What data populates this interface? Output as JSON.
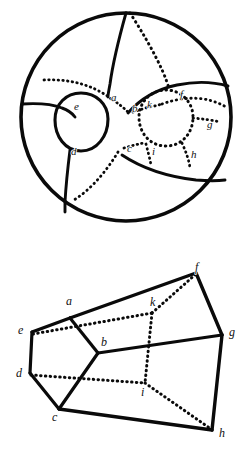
{
  "page": {
    "background_color": "#ffffff",
    "ink_color": "#0a0a0a",
    "width": 252,
    "height": 456
  },
  "figures": [
    {
      "id": "sphere-figure",
      "name": "sphere-with-two-holes-diagram",
      "description": "A circle (sphere outline) containing two inner ovals (holes) joined by solid and dotted curves dividing the surface into regions.",
      "outline": {
        "shape": "circle",
        "center_x": 126,
        "center_y": 117,
        "radius_x": 105,
        "radius_y": 104,
        "stroke_width": 3.4
      },
      "holes": [
        {
          "name": "left-hole",
          "center_x": 81,
          "center_y": 122,
          "rx": 26,
          "ry": 29,
          "style": "solid"
        },
        {
          "name": "right-hole",
          "center_x": 166,
          "center_y": 118,
          "rx": 27,
          "ry": 28,
          "style": "dotted"
        }
      ],
      "labels": [
        {
          "text": "a",
          "x": 111,
          "y": 101
        },
        {
          "text": "b",
          "x": 132,
          "y": 112
        },
        {
          "text": "c",
          "x": 127,
          "y": 152
        },
        {
          "text": "d",
          "x": 71,
          "y": 155
        },
        {
          "text": "e",
          "x": 74,
          "y": 110
        },
        {
          "text": "f",
          "x": 180,
          "y": 98
        },
        {
          "text": "g",
          "x": 207,
          "y": 128
        },
        {
          "text": "h",
          "x": 191,
          "y": 158
        },
        {
          "text": "i",
          "x": 152,
          "y": 155
        },
        {
          "text": "k",
          "x": 147,
          "y": 108
        }
      ]
    },
    {
      "id": "solid-figure",
      "name": "polyhedron-diagram",
      "description": "A wireframe polyhedron (prism-like solid) with solid visible edges and dotted hidden edges, labelled at ten vertices.",
      "vertices": [
        {
          "name": "a",
          "x": 70,
          "y": 318
        },
        {
          "name": "b",
          "x": 98,
          "y": 353
        },
        {
          "name": "c",
          "x": 59,
          "y": 409
        },
        {
          "name": "d",
          "x": 30,
          "y": 373
        },
        {
          "name": "e",
          "x": 32,
          "y": 332
        },
        {
          "name": "f",
          "x": 196,
          "y": 273
        },
        {
          "name": "g",
          "x": 222,
          "y": 335
        },
        {
          "name": "h",
          "x": 212,
          "y": 430
        },
        {
          "name": "i",
          "x": 145,
          "y": 383
        },
        {
          "name": "k",
          "x": 152,
          "y": 313
        }
      ],
      "labels": [
        {
          "text": "a",
          "x": 66,
          "y": 305
        },
        {
          "text": "b",
          "x": 101,
          "y": 346
        },
        {
          "text": "c",
          "x": 54,
          "y": 420
        },
        {
          "text": "d",
          "x": 19,
          "y": 376
        },
        {
          "text": "e",
          "x": 22,
          "y": 333
        },
        {
          "text": "f",
          "x": 197,
          "y": 272
        },
        {
          "text": "g",
          "x": 230,
          "y": 334
        },
        {
          "text": "h",
          "x": 220,
          "y": 436
        },
        {
          "text": "i",
          "x": 143,
          "y": 394
        },
        {
          "text": "k",
          "x": 153,
          "y": 305
        }
      ],
      "edges_solid": [
        "a-e",
        "a-f",
        "a-b",
        "b-c",
        "c-d",
        "d-e",
        "c-h",
        "f-g",
        "g-h",
        "b-g"
      ],
      "edges_dotted": [
        "e-a-inner",
        "d-i",
        "i-k",
        "k-f",
        "i-h",
        "b-k"
      ]
    }
  ]
}
